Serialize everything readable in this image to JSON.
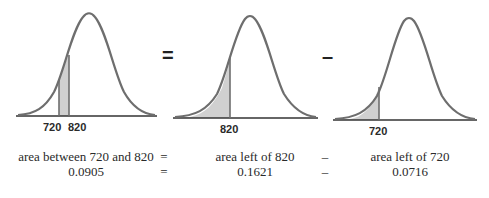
{
  "panels": [
    {
      "id": "between",
      "labels": [
        "720",
        "820"
      ],
      "shade": "between 720 and 820"
    },
    {
      "id": "left-820",
      "labels": [
        "820"
      ],
      "shade": "left of 820"
    },
    {
      "id": "left-720",
      "labels": [
        "720"
      ],
      "shade": "left of 720"
    }
  ],
  "operators": {
    "equals": "=",
    "minus": "–"
  },
  "equation": {
    "row1": {
      "left": "area between 720 and 820",
      "op1": "=",
      "mid": "area left of 820",
      "op2": "–",
      "right": "area left of 720"
    },
    "row2": {
      "left": "0.0905",
      "op1": "=",
      "mid": "0.1621",
      "op2": "–",
      "right": "0.0716"
    }
  },
  "colors": {
    "curve": "#6e6e6e",
    "shade": "#d0d0d0",
    "axis": "#333333"
  }
}
